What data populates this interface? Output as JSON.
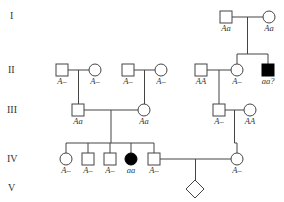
{
  "generations": [
    "I",
    "II",
    "III",
    "IV",
    "V"
  ],
  "individuals": [
    {
      "id": "I-1",
      "generation": "I",
      "sex": "male",
      "affected": false,
      "genotype": "Aa"
    },
    {
      "id": "I-2",
      "generation": "I",
      "sex": "female",
      "affected": false,
      "genotype": "Aa"
    },
    {
      "id": "II-1",
      "generation": "II",
      "sex": "male",
      "affected": false,
      "genotype": "A–"
    },
    {
      "id": "II-2",
      "generation": "II",
      "sex": "female",
      "affected": false,
      "genotype": "A–"
    },
    {
      "id": "II-3",
      "generation": "II",
      "sex": "male",
      "affected": false,
      "genotype": "A–"
    },
    {
      "id": "II-4",
      "generation": "II",
      "sex": "female",
      "affected": false,
      "genotype": "A–"
    },
    {
      "id": "II-5",
      "generation": "II",
      "sex": "male",
      "affected": false,
      "genotype": "AA"
    },
    {
      "id": "II-6",
      "generation": "II",
      "sex": "female",
      "affected": false,
      "genotype": "A–"
    },
    {
      "id": "II-7",
      "generation": "II",
      "sex": "male",
      "affected": true,
      "genotype": "aa?"
    },
    {
      "id": "III-1",
      "generation": "III",
      "sex": "male",
      "affected": false,
      "genotype": "Aa"
    },
    {
      "id": "III-2",
      "generation": "III",
      "sex": "female",
      "affected": false,
      "genotype": "Aa"
    },
    {
      "id": "III-3",
      "generation": "III",
      "sex": "male",
      "affected": false,
      "genotype": "A–"
    },
    {
      "id": "III-4",
      "generation": "III",
      "sex": "female",
      "affected": false,
      "genotype": "AA"
    },
    {
      "id": "IV-1",
      "generation": "IV",
      "sex": "female",
      "affected": false,
      "genotype": "A–"
    },
    {
      "id": "IV-2",
      "generation": "IV",
      "sex": "male",
      "affected": false,
      "genotype": "A–"
    },
    {
      "id": "IV-3",
      "generation": "IV",
      "sex": "male",
      "affected": false,
      "genotype": "A–"
    },
    {
      "id": "IV-4",
      "generation": "IV",
      "sex": "female",
      "affected": true,
      "genotype": "aa"
    },
    {
      "id": "IV-5",
      "generation": "IV",
      "sex": "male",
      "affected": false,
      "genotype": "A–"
    },
    {
      "id": "IV-6",
      "generation": "IV",
      "sex": "female",
      "affected": false,
      "genotype": "A–"
    },
    {
      "id": "V-1",
      "generation": "V",
      "sex": "unknown",
      "affected": false,
      "genotype": ""
    }
  ],
  "matings": [
    {
      "partners": [
        "I-1",
        "I-2"
      ],
      "children": [
        "II-6",
        "II-7"
      ]
    },
    {
      "partners": [
        "II-1",
        "II-2"
      ],
      "children": [
        "III-1"
      ]
    },
    {
      "partners": [
        "II-3",
        "II-4"
      ],
      "children": [
        "III-2"
      ]
    },
    {
      "partners": [
        "II-5",
        "II-6"
      ],
      "children": [
        "III-3"
      ]
    },
    {
      "partners": [
        "III-1",
        "III-2"
      ],
      "children": [
        "IV-1",
        "IV-2",
        "IV-3",
        "IV-4",
        "IV-5"
      ]
    },
    {
      "partners": [
        "III-3",
        "III-4"
      ],
      "children": [
        "IV-6"
      ]
    },
    {
      "partners": [
        "IV-5",
        "IV-6"
      ],
      "children": [
        "V-1"
      ]
    }
  ]
}
